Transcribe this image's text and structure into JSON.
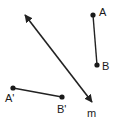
{
  "figure": {
    "type": "geometry-diagram",
    "background_color": "#ffffff",
    "stroke_color": "#222222",
    "width": 116,
    "height": 122,
    "labels": {
      "A": "A",
      "B": "B",
      "A_prime": "A'",
      "B_prime": "B'",
      "m": "m"
    },
    "points": [
      {
        "name": "A",
        "label": "A",
        "x": 93,
        "y": 15
      },
      {
        "name": "B",
        "label": "B",
        "x": 97,
        "y": 65
      },
      {
        "name": "A'",
        "label": "A'",
        "x": 13,
        "y": 88
      },
      {
        "name": "B'",
        "label": "B'",
        "x": 62,
        "y": 97
      }
    ],
    "segments": [
      {
        "name": "segment-AB",
        "from": "A",
        "to": "B",
        "x1": 93,
        "y1": 15,
        "x2": 97,
        "y2": 65
      },
      {
        "name": "segment-A'B'",
        "from": "A'",
        "to": "B'",
        "x1": 13,
        "y1": 88,
        "x2": 62,
        "y2": 97
      }
    ],
    "lines": [
      {
        "name": "line-m",
        "label": "m",
        "x1": 23,
        "y1": 12,
        "x2": 94,
        "y2": 105,
        "arrow_start": true,
        "arrow_end": true
      }
    ]
  }
}
